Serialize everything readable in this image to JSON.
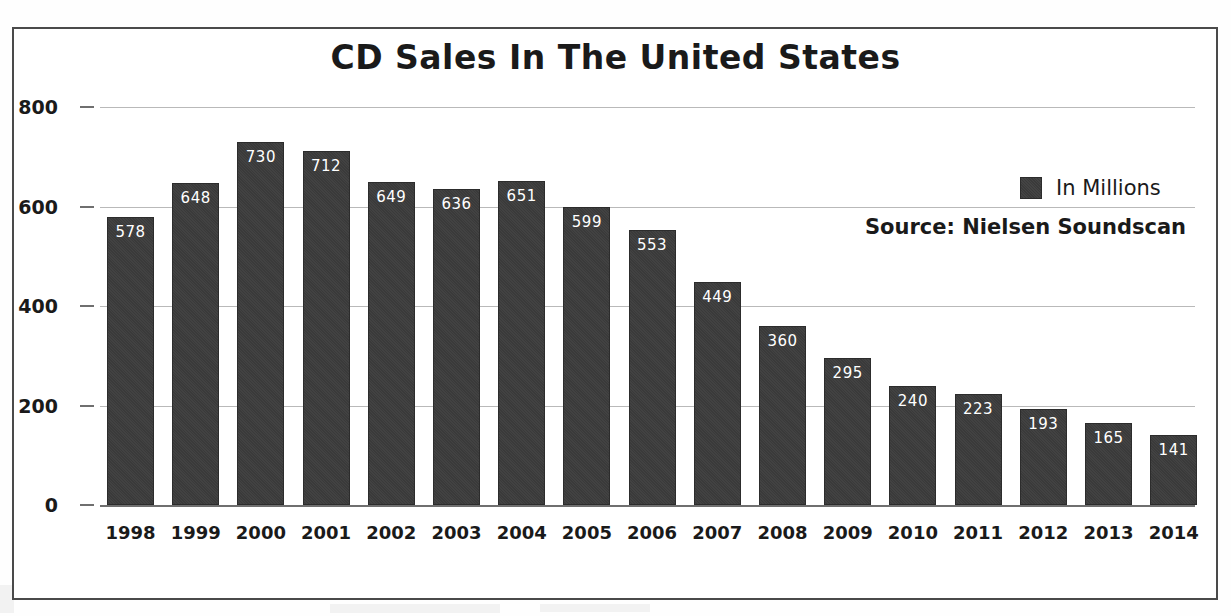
{
  "frame": {
    "border_color": "#4a4a4a",
    "background": "#ffffff"
  },
  "chart_data": {
    "type": "bar",
    "title": "CD Sales In The United States",
    "xlabel": "",
    "ylabel": "",
    "ylim": [
      0,
      800
    ],
    "yticks": [
      0,
      200,
      400,
      600,
      800
    ],
    "grid": true,
    "legend_position": "upper-right",
    "legend": [
      "In Millions"
    ],
    "annotations": [
      "Source: Nielsen Soundscan"
    ],
    "bar_color": "#3a3a3a",
    "value_label_color": "#ffffff",
    "categories": [
      "1998",
      "1999",
      "2000",
      "2001",
      "2002",
      "2003",
      "2004",
      "2005",
      "2006",
      "2007",
      "2008",
      "2009",
      "2010",
      "2011",
      "2012",
      "2013",
      "2014"
    ],
    "values": [
      578,
      648,
      730,
      712,
      649,
      636,
      651,
      599,
      553,
      449,
      360,
      295,
      240,
      223,
      193,
      165,
      141
    ]
  },
  "legend": {
    "label": "In Millions",
    "swatch_color": "#3a3a3a"
  },
  "source": {
    "text": "Source: Nielsen Soundscan"
  }
}
